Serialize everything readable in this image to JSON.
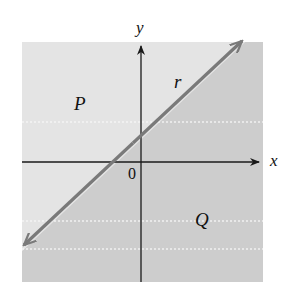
{
  "diagram": {
    "type": "half-plane diagram",
    "axes": {
      "x_label": "x",
      "y_label": "y",
      "origin_label": "0"
    },
    "line": {
      "label": "r",
      "color": "#7a7a7a"
    },
    "regions": [
      {
        "label": "P",
        "position": "above-left of line r",
        "color": "#e4e4e4"
      },
      {
        "label": "Q",
        "position": "below-right of line r",
        "color": "#cdcdcd"
      }
    ],
    "colors": {
      "axis": "#1a1a1a",
      "background": "#ffffff",
      "region_P": "#e4e4e4",
      "region_Q": "#cdcdcd",
      "line_r": "#7a7a7a",
      "dotted_guides": "#f4f4f4"
    }
  }
}
